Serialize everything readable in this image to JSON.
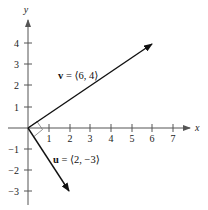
{
  "diagram": {
    "type": "coordinate-plane-vectors",
    "axes": {
      "x_label": "x",
      "y_label": "y",
      "x_ticks": [
        "1",
        "2",
        "3",
        "4",
        "5",
        "6",
        "7"
      ],
      "y_ticks_positive": [
        "1",
        "2",
        "3",
        "4"
      ],
      "y_ticks_negative": [
        "−1",
        "−2",
        "−3"
      ]
    },
    "vectors": [
      {
        "name": "v",
        "components": [
          6,
          4
        ],
        "label_name": "v",
        "label_rest": " = ⟨6, 4⟩"
      },
      {
        "name": "u",
        "components": [
          2,
          -3
        ],
        "label_name": "u",
        "label_rest": " = ⟨2, −3⟩"
      }
    ],
    "right_angle_marker": true,
    "colors": {
      "axis": "#555555",
      "vector": "#111111",
      "background": "#ffffff"
    }
  }
}
